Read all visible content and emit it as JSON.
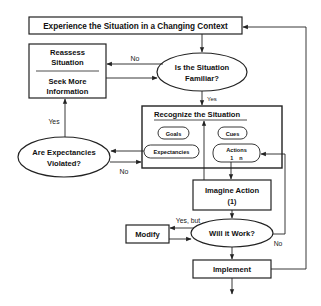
{
  "diagram": {
    "type": "flowchart",
    "colors": {
      "stroke": "#222222",
      "text": "#111111",
      "background": "#ffffff"
    },
    "nodes": {
      "experience": {
        "shape": "rect",
        "label": "Experience the Situation in a Changing Context"
      },
      "reassess": {
        "shape": "rect",
        "label_top_1": "Reassess",
        "label_top_2": "Situation",
        "label_bottom_1": "Seek More",
        "label_bottom_2": "Information"
      },
      "familiar": {
        "shape": "ellipse",
        "label_1": "Is the Situation",
        "label_2": "Familiar?"
      },
      "recognize": {
        "shape": "rect",
        "title": "Recognize the Situation",
        "items": {
          "goals": "Goals",
          "cues": "Cues",
          "expectancies": "Expectancies",
          "actions": "Actions",
          "actions_range": "1    n"
        }
      },
      "violated": {
        "shape": "ellipse",
        "label_1": "Are Expectancies",
        "label_2": "Violated?"
      },
      "imagine": {
        "shape": "rect",
        "label_1": "Imagine Action",
        "label_2": "(1)"
      },
      "will_work": {
        "shape": "ellipse",
        "label": "Will it Work?"
      },
      "modify": {
        "shape": "rect",
        "label": "Modify"
      },
      "implement": {
        "shape": "rect",
        "label": "Implement"
      }
    },
    "edge_labels": {
      "familiar_no": "No",
      "familiar_yes": "Yes",
      "violated_yes": "Yes",
      "violated_no": "No",
      "will_work_yes_but": "Yes, but",
      "will_work_no": "No"
    },
    "edges": [
      {
        "from": "experience",
        "to": "familiar"
      },
      {
        "from": "familiar",
        "to": "reassess",
        "label": "No"
      },
      {
        "from": "reassess",
        "to": "familiar"
      },
      {
        "from": "familiar",
        "to": "recognize",
        "label": "Yes"
      },
      {
        "from": "recognize.expectancies",
        "to": "violated"
      },
      {
        "from": "violated",
        "to": "reassess",
        "label": "Yes"
      },
      {
        "from": "violated",
        "to": "recognize",
        "label": "No"
      },
      {
        "from": "recognize.actions",
        "to": "imagine"
      },
      {
        "from": "imagine",
        "to": "recognize"
      },
      {
        "from": "imagine",
        "to": "will_work"
      },
      {
        "from": "will_work",
        "to": "modify",
        "label": "Yes, but"
      },
      {
        "from": "modify",
        "to": "will_work"
      },
      {
        "from": "will_work",
        "to": "recognize.actions",
        "label": "No"
      },
      {
        "from": "will_work",
        "to": "implement"
      },
      {
        "from": "implement",
        "to": "experience"
      }
    ]
  }
}
